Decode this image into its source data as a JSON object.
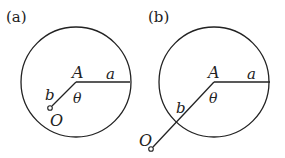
{
  "figures": [
    {
      "id": "a",
      "panel_label": "(a)",
      "center_label": "A",
      "radius_label": "a",
      "offset_label": "b",
      "angle_label": "θ",
      "point_label": "O",
      "description": "Point O lies inside the circle of radius a centered at A, at distance b from A (b < a)"
    },
    {
      "id": "b",
      "panel_label": "(b)",
      "center_label": "A",
      "radius_label": "a",
      "offset_label": "b",
      "angle_label": "θ",
      "point_label": "O",
      "description": "Point O lies outside the circle of radius a centered at A, at distance b from A (b > a)"
    }
  ],
  "colors": {
    "stroke": "#222222",
    "background": "#ffffff"
  }
}
